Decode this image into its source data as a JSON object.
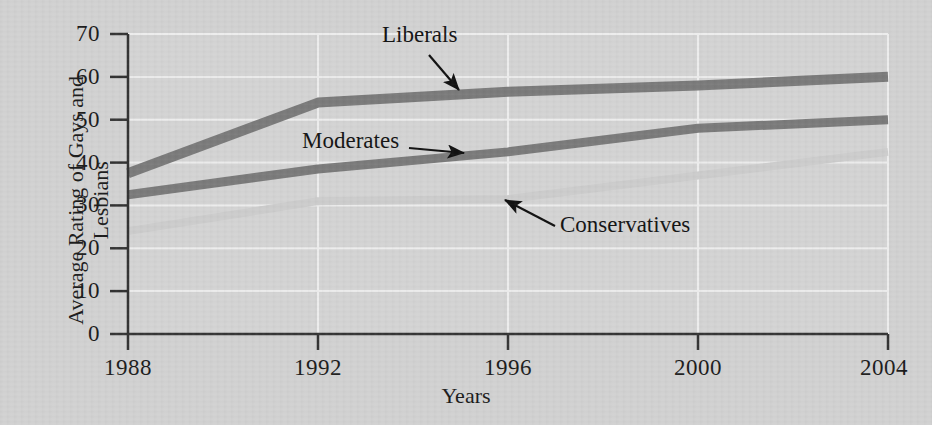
{
  "figure": {
    "background_color": "#d2d2d2",
    "gridline_color": "#efefef",
    "axis_color": "#3a3a3a"
  },
  "chart_data": {
    "type": "line",
    "title": "",
    "xlabel": "Years",
    "ylabel": "Average Rating of Gays and Lesbians",
    "x": [
      1988,
      1992,
      1996,
      2000,
      2004
    ],
    "categories": [
      "1988",
      "1992",
      "1996",
      "2000",
      "2004"
    ],
    "xlim": [
      1988,
      2004
    ],
    "ylim": [
      0,
      70
    ],
    "yticks": [
      0,
      10,
      20,
      30,
      40,
      50,
      60,
      70
    ],
    "xticks": [
      1988,
      1992,
      1996,
      2000,
      2004
    ],
    "grid": true,
    "legend_position": "inline-annotations",
    "series": [
      {
        "name": "Liberals",
        "color": "#7b7b7b",
        "values": [
          37.5,
          54,
          56.5,
          58,
          60
        ]
      },
      {
        "name": "Moderates",
        "color": "#7b7b7b",
        "values": [
          32.5,
          38.5,
          42.5,
          48,
          50
        ]
      },
      {
        "name": "Conservatives",
        "color": "#cdcdcd",
        "values": [
          24,
          31,
          31.5,
          37,
          42.5
        ]
      }
    ],
    "annotations": [
      {
        "label": "Liberals",
        "target_series": "Liberals"
      },
      {
        "label": "Moderates",
        "target_series": "Moderates"
      },
      {
        "label": "Conservatives",
        "target_series": "Conservatives"
      }
    ]
  },
  "y_axis": {
    "title": "Average Rating of Gays and Lesbians",
    "ticks": [
      {
        "label": "70"
      },
      {
        "label": "60"
      },
      {
        "label": "50"
      },
      {
        "label": "40"
      },
      {
        "label": "30"
      },
      {
        "label": "20"
      },
      {
        "label": "10"
      },
      {
        "label": "0"
      }
    ]
  },
  "x_axis": {
    "title": "Years",
    "ticks": [
      {
        "label": "1988"
      },
      {
        "label": "1992"
      },
      {
        "label": "1996"
      },
      {
        "label": "2000"
      },
      {
        "label": "2004"
      }
    ]
  },
  "annotations": {
    "liberals": "Liberals",
    "moderates": "Moderates",
    "conservatives": "Conservatives"
  }
}
